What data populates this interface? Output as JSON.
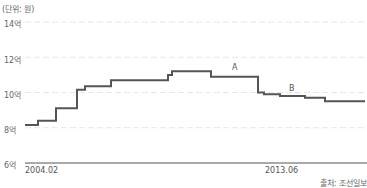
{
  "chart_data": {
    "type": "line",
    "style": "step",
    "unit_label": "(단위: 원)",
    "y_ticks": [
      "14억",
      "12억",
      "10억",
      "8억",
      "6억"
    ],
    "ylim": [
      6,
      14
    ],
    "x_tick_labels": [
      "2004.02",
      "2013.06"
    ],
    "annotations": [
      {
        "label": "A",
        "x_px": 235,
        "value": 11.0
      },
      {
        "label": "B",
        "x_px": 292,
        "value": 9.8
      }
    ],
    "source": "출처: 조선일보",
    "grid": true,
    "series": [
      {
        "name": "price",
        "color": "#555555",
        "steps": [
          {
            "x0": 25,
            "x1": 38,
            "value": 8.15
          },
          {
            "x0": 38,
            "x1": 56,
            "value": 8.4
          },
          {
            "x0": 56,
            "x1": 77,
            "value": 9.1
          },
          {
            "x0": 77,
            "x1": 85,
            "value": 10.15
          },
          {
            "x0": 85,
            "x1": 111,
            "value": 10.35
          },
          {
            "x0": 111,
            "x1": 168,
            "value": 10.7
          },
          {
            "x0": 168,
            "x1": 172,
            "value": 11.0
          },
          {
            "x0": 172,
            "x1": 211,
            "value": 11.2
          },
          {
            "x0": 211,
            "x1": 258,
            "value": 10.9
          },
          {
            "x0": 258,
            "x1": 264,
            "value": 10.0
          },
          {
            "x0": 264,
            "x1": 280,
            "value": 9.9
          },
          {
            "x0": 280,
            "x1": 305,
            "value": 9.8
          },
          {
            "x0": 305,
            "x1": 325,
            "value": 9.7
          },
          {
            "x0": 325,
            "x1": 365,
            "value": 9.5
          }
        ]
      }
    ]
  }
}
